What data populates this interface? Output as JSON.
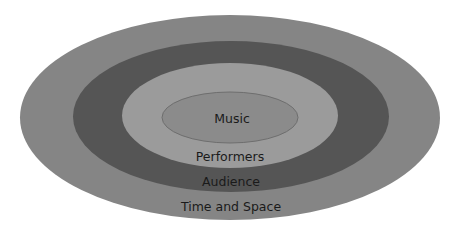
{
  "diagram": {
    "type": "concentric-ellipses",
    "layers": [
      {
        "id": "time-and-space",
        "label": "Time and Space",
        "color": "#858585",
        "cx": 230,
        "cy": 117.5,
        "rx": 210,
        "ry": 102.5,
        "label_x": 231,
        "label_y": 211
      },
      {
        "id": "audience",
        "label": "Audience",
        "color": "#555555",
        "cx": 231,
        "cy": 116.5,
        "rx": 158,
        "ry": 75.5,
        "label_x": 231,
        "label_y": 186
      },
      {
        "id": "performers",
        "label": "Performers",
        "color": "#9b9b9b",
        "cx": 230,
        "cy": 115.5,
        "rx": 108,
        "ry": 52.5,
        "label_x": 230,
        "label_y": 161
      },
      {
        "id": "music",
        "label": "Music",
        "color": "#8b8b8b",
        "stroke": "#6e6e6e",
        "cx": 230,
        "cy": 117.5,
        "rx": 68,
        "ry": 25.5,
        "label_x": 232,
        "label_y": 123
      }
    ]
  }
}
